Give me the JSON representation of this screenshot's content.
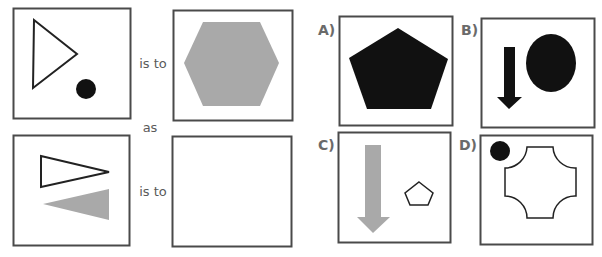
{
  "puzzle": {
    "relation_text_1": "is to",
    "connector_text": "as",
    "relation_text_2": "is to",
    "colors": {
      "frame": "#4a4a4a",
      "black": "#111111",
      "gray": "#a9a9a9",
      "text": "#5a5a5a"
    },
    "panels": [
      {
        "id": "premise-1",
        "contents": [
          "outline-triangle-pointing-right",
          "small-black-circle"
        ]
      },
      {
        "id": "premise-2",
        "contents": [
          "gray-hexagon"
        ]
      },
      {
        "id": "query-1",
        "contents": [
          "outline-thin-triangle-pointing-right",
          "gray-triangle-pointing-left"
        ]
      },
      {
        "id": "query-2",
        "contents": []
      }
    ],
    "options": [
      {
        "label": "A)",
        "contents": [
          "black-pentagon"
        ]
      },
      {
        "label": "B)",
        "contents": [
          "black-down-arrow",
          "black-ellipse"
        ]
      },
      {
        "label": "C)",
        "contents": [
          "gray-down-arrow",
          "outline-small-pentagon"
        ]
      },
      {
        "label": "D)",
        "contents": [
          "small-black-circle",
          "outline-concave-cross"
        ]
      }
    ]
  }
}
